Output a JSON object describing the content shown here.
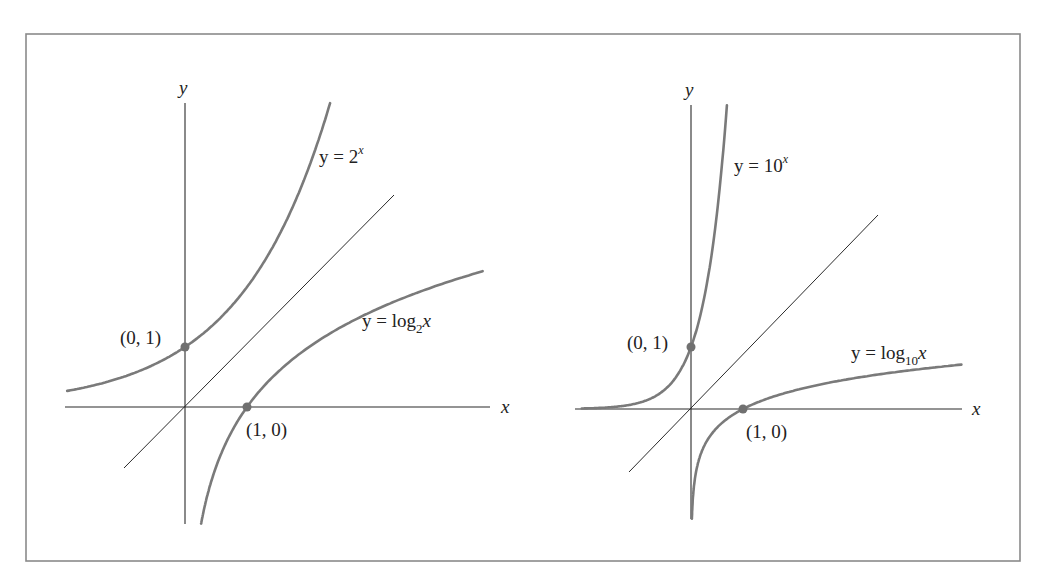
{
  "figure": {
    "panels": [
      {
        "id": "left",
        "axis_labels": {
          "x": "x",
          "y": "y"
        },
        "exp_label": {
          "prefix": "y = 2",
          "exponent": "x"
        },
        "log_label": {
          "prefix": "y = log",
          "base": "2",
          "arg": "x"
        },
        "point_labels": {
          "y_intercept": "(0, 1)",
          "x_intercept": "(1, 0)"
        }
      },
      {
        "id": "right",
        "axis_labels": {
          "x": "x",
          "y": "y"
        },
        "exp_label": {
          "prefix": "y = 10",
          "exponent": "x"
        },
        "log_label": {
          "prefix": "y = log",
          "base": "10",
          "arg": "x"
        },
        "point_labels": {
          "y_intercept": "(0, 1)",
          "x_intercept": "(1, 0)"
        }
      }
    ]
  },
  "chart_data": [
    {
      "type": "line",
      "title": "",
      "xlabel": "x",
      "ylabel": "y",
      "grid": false,
      "series": [
        {
          "name": "y = 2^x",
          "function": "2^x",
          "x_range": [
            -1.9,
            2.34
          ]
        },
        {
          "name": "y = x",
          "function": "x",
          "x_range": [
            -1.0,
            3.5
          ],
          "style": "thin reference line"
        },
        {
          "name": "y = log2 x",
          "function": "log2(x)",
          "x_range": [
            0.26,
            4.8
          ]
        }
      ],
      "marked_points": [
        {
          "label": "(0, 1)",
          "x": 0,
          "y": 1
        },
        {
          "label": "(1, 0)",
          "x": 1,
          "y": 0
        }
      ],
      "xlim": [
        -1.95,
        5.0
      ],
      "ylim": [
        -1.95,
        5.1
      ]
    },
    {
      "type": "line",
      "title": "",
      "xlabel": "x",
      "ylabel": "y",
      "grid": false,
      "series": [
        {
          "name": "y = 10^x",
          "function": "10^x",
          "x_range": [
            -2.1,
            0.69
          ]
        },
        {
          "name": "y = x",
          "function": "x",
          "x_range": [
            -1.2,
            3.6
          ],
          "style": "thin reference line"
        },
        {
          "name": "y = log10 x",
          "function": "log10(x)",
          "x_range": [
            0.017,
            5.2
          ]
        }
      ],
      "marked_points": [
        {
          "label": "(0, 1)",
          "x": 0,
          "y": 1
        },
        {
          "label": "(1, 0)",
          "x": 1,
          "y": 0
        }
      ],
      "xlim": [
        -2.2,
        5.4
      ],
      "ylim": [
        -1.8,
        4.9
      ]
    }
  ]
}
